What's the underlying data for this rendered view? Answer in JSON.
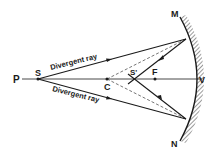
{
  "diagram": {
    "colors": {
      "ink": "#1a1a1a",
      "background": "#ffffff",
      "mirror_hatch": "#555555"
    },
    "points": {
      "P": {
        "label": "P",
        "x": 18,
        "y": 79
      },
      "S": {
        "label": "S",
        "x": 38,
        "y": 79
      },
      "C": {
        "label": "C",
        "x": 107,
        "y": 79
      },
      "S_prime": {
        "label": "S'",
        "x": 133,
        "y": 79
      },
      "F": {
        "label": "F",
        "x": 155,
        "y": 79
      },
      "V": {
        "label": "V",
        "x": 200,
        "y": 79
      },
      "M": {
        "label": "M",
        "x": 178,
        "y": 14
      },
      "N": {
        "label": "N",
        "x": 178,
        "y": 142
      }
    },
    "rays": [
      {
        "label": "Divergent ray",
        "from": "S",
        "to_mirror": [
          186,
          39
        ]
      },
      {
        "label": "Divergent ray",
        "from": "S",
        "to_mirror": [
          186,
          119
        ]
      }
    ],
    "labels": {
      "P": "P",
      "S": "S",
      "C": "C",
      "S_prime": "S'",
      "F": "F",
      "V": "V",
      "M": "M",
      "N": "N",
      "ray_upper": "Divergent ray",
      "ray_lower": "Divergent ray"
    }
  }
}
